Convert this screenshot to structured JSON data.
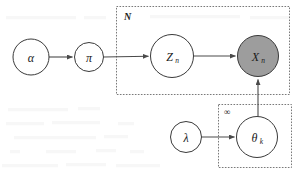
{
  "diagram": {
    "type": "plate-notation-graphical-model",
    "title": "",
    "background_color": "#ffffff",
    "stroke_color": "#3a3a3a",
    "observed_fill": "#9d9d9d",
    "latent_fill": "#ffffff",
    "plate_stroke": "#6b6b6b",
    "nodes": [
      {
        "id": "alpha",
        "label": "α",
        "subscript": "",
        "cx": 31,
        "cy": 57,
        "r": 18,
        "observed": false,
        "font_size": 13
      },
      {
        "id": "pi",
        "label": "π",
        "subscript": "",
        "cx": 89,
        "cy": 57,
        "r": 14.5,
        "observed": false,
        "font_size": 12
      },
      {
        "id": "z_n",
        "label": "Z",
        "subscript": "n",
        "cx": 172,
        "cy": 56,
        "r": 21.5,
        "observed": false,
        "font_size": 13
      },
      {
        "id": "x_n",
        "label": "X",
        "subscript": "n",
        "cx": 258,
        "cy": 56,
        "r": 20.5,
        "observed": true,
        "font_size": 13
      },
      {
        "id": "lambda",
        "label": "λ",
        "subscript": "",
        "cx": 186,
        "cy": 137,
        "r": 15.5,
        "observed": false,
        "font_size": 12
      },
      {
        "id": "theta_k",
        "label": "θ",
        "subscript": "k",
        "cx": 257,
        "cy": 137,
        "r": 20.5,
        "observed": false,
        "font_size": 13
      }
    ],
    "edges": [
      {
        "id": "alpha-to-pi",
        "from": "alpha",
        "to": "pi",
        "direction": "horizontal"
      },
      {
        "id": "pi-to-zn",
        "from": "pi",
        "to": "z_n",
        "direction": "horizontal"
      },
      {
        "id": "zn-to-xn",
        "from": "z_n",
        "to": "x_n",
        "direction": "horizontal"
      },
      {
        "id": "lambda-to-thetak",
        "from": "lambda",
        "to": "theta_k",
        "direction": "horizontal"
      },
      {
        "id": "thetak-to-xn",
        "from": "theta_k",
        "to": "x_n",
        "direction": "vertical-up"
      }
    ],
    "plates": [
      {
        "id": "plate-n",
        "label": "N",
        "x": 116,
        "y": 6,
        "width": 174,
        "height": 89,
        "label_x": 124,
        "label_y": 13
      },
      {
        "id": "plate-infinity",
        "label": "∞",
        "x": 218,
        "y": 104,
        "width": 74,
        "height": 64,
        "label_x": 224,
        "label_y": 109
      }
    ]
  }
}
